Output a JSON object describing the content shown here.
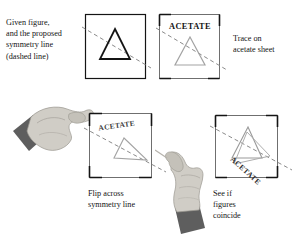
{
  "figure": {
    "background_color": "#ffffff",
    "ink_color": "#141414",
    "acetate_ink_color": "#9a9a9a",
    "dashed_line_color": "#8a8a8a",
    "hand_skin_color": "#d0cdc6",
    "hand_shadow_color": "#a9a6a0",
    "sleeve_color": "#5e5e5e"
  },
  "captions": {
    "step1": "Given figure,\nand the proposed\nsymmetry line\n(dashed line)",
    "step2": "Trace on\nacetate sheet",
    "step3": "Flip across\nsymmetry line",
    "step4": "See if\nfigures\ncoincide"
  },
  "panels": [
    {
      "id": "panel-1",
      "name": "given-figure-panel",
      "acetate_label": "",
      "triangle_style": "solid-black",
      "has_dashed_line": true,
      "description": "Square frame containing a black equilateral triangle crossed by a dashed symmetry line running from upper-left to lower-right"
    },
    {
      "id": "panel-2",
      "name": "traced-acetate-panel",
      "acetate_label": "ACETATE",
      "triangle_style": "light-gray-traced",
      "has_dashed_line": true,
      "description": "Acetate sheet with the triangle and dashed line traced in light gray, labelled ACETATE"
    },
    {
      "id": "panel-3",
      "name": "flipped-acetate-panel",
      "acetate_label": "ACETATE",
      "triangle_style": "light-gray-traced",
      "has_dashed_line": true,
      "description": "The acetate sheet flipped over across the symmetry line; the ACETATE label is now tilted and mirrored"
    },
    {
      "id": "panel-4",
      "name": "coincide-check-panel",
      "acetate_label": "ACETATE",
      "triangle_style": "overlapping-gray",
      "has_dashed_line": true,
      "description": "Flipped acetate laid over the original figure so the two triangles can be compared; ACETATE label runs diagonally and mirrored"
    }
  ],
  "hands": [
    {
      "id": "hand-left",
      "name": "hand-holding-acetate-left",
      "description": "Hand with dark sleeve pinching the corner of the acetate sheet from the left"
    },
    {
      "id": "hand-right",
      "name": "hand-holding-acetate-right",
      "description": "Hand with dark sleeve pinching the acetate sheet, pointing up-left"
    }
  ]
}
